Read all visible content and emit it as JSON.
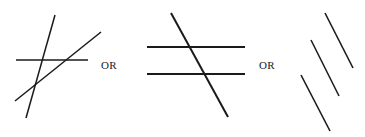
{
  "figure": {
    "width": 365,
    "height": 137,
    "background_color": "#ffffff",
    "stroke_color": "#1a1a1a",
    "caption_font": "serif"
  },
  "separators": [
    {
      "name": "or-label-1",
      "text": "OR",
      "x": 101,
      "y": 60
    },
    {
      "name": "or-label-2",
      "text": "OR",
      "x": 259,
      "y": 60
    }
  ],
  "groups": [
    {
      "id": "group-1",
      "name": "three-mutually-intersecting-lines",
      "description": "Three straight lines that all cross one another, forming a small central triangle",
      "line_count": 3,
      "intersections": 3,
      "lines": [
        {
          "name": "horizontal-line",
          "x1": 16,
          "y1": 60,
          "x2": 88,
          "y2": 60,
          "width": 1.5,
          "orientation": "horizontal"
        },
        {
          "name": "steep-ascending-line",
          "x1": 26,
          "y1": 118,
          "x2": 55,
          "y2": 15,
          "width": 1.5,
          "orientation": "steep-diagonal"
        },
        {
          "name": "shallow-ascending-line",
          "x1": 15,
          "y1": 101,
          "x2": 101,
          "y2": 32,
          "width": 1.5,
          "orientation": "diagonal"
        }
      ]
    },
    {
      "id": "group-2",
      "name": "two-parallels-crossed-by-transversal",
      "description": "Two parallel horizontal lines cut by a single descending transversal",
      "line_count": 3,
      "intersections": 2,
      "lines": [
        {
          "name": "upper-horizontal-line",
          "x1": 147,
          "y1": 47,
          "x2": 245,
          "y2": 47,
          "width": 2,
          "orientation": "horizontal"
        },
        {
          "name": "lower-horizontal-line",
          "x1": 147,
          "y1": 74,
          "x2": 245,
          "y2": 74,
          "width": 2,
          "orientation": "horizontal"
        },
        {
          "name": "transversal-line",
          "x1": 171,
          "y1": 13,
          "x2": 228,
          "y2": 117,
          "width": 2,
          "orientation": "descending-diagonal"
        }
      ]
    },
    {
      "id": "group-3",
      "name": "three-parallel-offset-segments",
      "description": "Three parallel diagonal segments arranged in a staircase, none intersecting",
      "line_count": 3,
      "intersections": 0,
      "lines": [
        {
          "name": "upper-right-segment",
          "x1": 325,
          "y1": 13,
          "x2": 353,
          "y2": 68,
          "width": 1.6,
          "orientation": "descending-diagonal"
        },
        {
          "name": "middle-segment",
          "x1": 311,
          "y1": 40,
          "x2": 339,
          "y2": 96,
          "width": 1.6,
          "orientation": "descending-diagonal"
        },
        {
          "name": "lower-left-segment",
          "x1": 301,
          "y1": 75,
          "x2": 330,
          "y2": 131,
          "width": 1.6,
          "orientation": "descending-diagonal"
        }
      ]
    }
  ]
}
